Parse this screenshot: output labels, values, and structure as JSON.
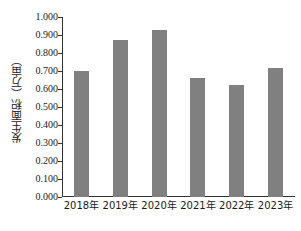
{
  "chart_data": {
    "type": "bar",
    "title": "",
    "subtitle": "",
    "xlabel": "",
    "ylabel": "发生面积（万亩）",
    "categories": [
      "2018年",
      "2019年",
      "2020年",
      "2021年",
      "2022年",
      "2023年"
    ],
    "values": [
      0.7,
      0.875,
      0.93,
      0.66,
      0.62,
      0.715
    ],
    "series": [
      {
        "name": "发生面积",
        "values": [
          0.7,
          0.875,
          0.93,
          0.66,
          0.62,
          0.715
        ]
      }
    ],
    "ylim": [
      0.0,
      1.0
    ],
    "ytick_step": 0.1,
    "ytick_labels": [
      "0.000",
      "0.100",
      "0.200",
      "0.300",
      "0.400",
      "0.500",
      "0.600",
      "0.700",
      "0.800",
      "0.900",
      "1.000"
    ],
    "ytick_values": [
      0.0,
      0.1,
      0.2,
      0.3,
      0.4,
      0.5,
      0.6,
      0.7,
      0.8,
      0.9,
      1.0
    ],
    "grid": false,
    "legend": false,
    "legend_position": "none",
    "bar_color": "#808080",
    "axis_color": "#333333",
    "background_color": "#ffffff"
  }
}
